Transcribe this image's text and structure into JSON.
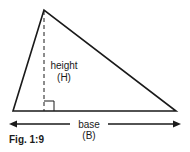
{
  "figure": {
    "caption": "Fig. 1:9",
    "height_label": "height",
    "height_symbol": "(H)",
    "base_label": "base",
    "base_symbol": "(B)"
  },
  "colors": {
    "stroke": "#1a1a1a",
    "background": "#ffffff"
  }
}
